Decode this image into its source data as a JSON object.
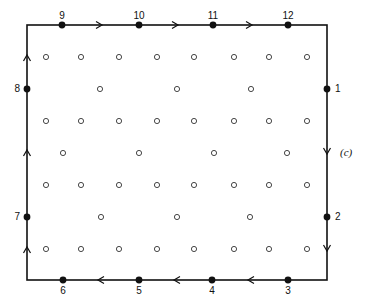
{
  "figure": {
    "panel_label": "(c)",
    "loop": {
      "rect": {
        "x1": 27,
        "y1": 25,
        "x2": 327,
        "y2": 280
      },
      "stroke": "#111111",
      "direction": "clockwise"
    },
    "points": [
      {
        "label": "1",
        "x": 327,
        "y": 89,
        "lx": 335,
        "ly": 92,
        "anchor": "start"
      },
      {
        "label": "2",
        "x": 327,
        "y": 217,
        "lx": 335,
        "ly": 220,
        "anchor": "start"
      },
      {
        "label": "3",
        "x": 288,
        "y": 280,
        "lx": 288,
        "ly": 294,
        "anchor": "middle"
      },
      {
        "label": "4",
        "x": 212,
        "y": 280,
        "lx": 212,
        "ly": 294,
        "anchor": "middle"
      },
      {
        "label": "5",
        "x": 139,
        "y": 280,
        "lx": 139,
        "ly": 294,
        "anchor": "middle"
      },
      {
        "label": "6",
        "x": 63,
        "y": 280,
        "lx": 63,
        "ly": 294,
        "anchor": "middle"
      },
      {
        "label": "7",
        "x": 27,
        "y": 217,
        "lx": 20,
        "ly": 220,
        "anchor": "end"
      },
      {
        "label": "8",
        "x": 27,
        "y": 89,
        "lx": 20,
        "ly": 92,
        "anchor": "end"
      },
      {
        "label": "9",
        "x": 62,
        "y": 25,
        "lx": 62,
        "ly": 19,
        "anchor": "middle"
      },
      {
        "label": "10",
        "x": 139,
        "y": 25,
        "lx": 139,
        "ly": 19,
        "anchor": "middle"
      },
      {
        "label": "11",
        "x": 213,
        "y": 25,
        "lx": 213,
        "ly": 19,
        "anchor": "middle"
      },
      {
        "label": "12",
        "x": 288,
        "y": 25,
        "lx": 288,
        "ly": 19,
        "anchor": "middle"
      }
    ],
    "arrows": [
      {
        "x": 100,
        "y": 25,
        "dir": "right"
      },
      {
        "x": 176,
        "y": 25,
        "dir": "right"
      },
      {
        "x": 250,
        "y": 25,
        "dir": "right"
      },
      {
        "x": 327,
        "y": 152,
        "dir": "down"
      },
      {
        "x": 327,
        "y": 249,
        "dir": "down"
      },
      {
        "x": 250,
        "y": 280,
        "dir": "left"
      },
      {
        "x": 176,
        "y": 280,
        "dir": "left"
      },
      {
        "x": 100,
        "y": 280,
        "dir": "left"
      },
      {
        "x": 27,
        "y": 249,
        "dir": "up"
      },
      {
        "x": 27,
        "y": 152,
        "dir": "up"
      },
      {
        "x": 27,
        "y": 57,
        "dir": "up"
      }
    ],
    "lattice_rows": [
      {
        "y": 57,
        "xs": [
          46,
          81,
          119,
          157,
          194,
          234,
          269,
          307
        ]
      },
      {
        "y": 89,
        "xs": [
          100,
          177,
          251
        ]
      },
      {
        "y": 121,
        "xs": [
          46,
          81,
          119,
          157,
          194,
          234,
          269,
          307
        ]
      },
      {
        "y": 153,
        "xs": [
          63,
          139,
          214,
          287
        ]
      },
      {
        "y": 185,
        "xs": [
          46,
          81,
          119,
          157,
          194,
          234,
          269,
          307
        ]
      },
      {
        "y": 217,
        "xs": [
          101,
          177,
          250
        ]
      },
      {
        "y": 249,
        "xs": [
          46,
          81,
          119,
          157,
          194,
          234,
          269,
          307
        ]
      }
    ],
    "panel_label_pos": {
      "x": 340,
      "y": 156
    }
  }
}
